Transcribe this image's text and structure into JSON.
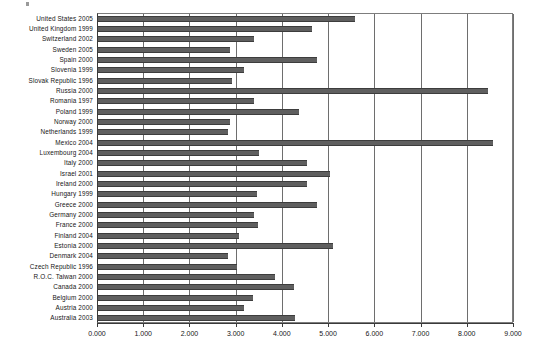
{
  "chart_data": {
    "type": "bar",
    "orientation": "horizontal",
    "title": "",
    "subtitle": "",
    "xlabel": "",
    "ylabel": "",
    "xlim": [
      0.0,
      9.0
    ],
    "xticks": [
      0.0,
      1.0,
      2.0,
      3.0,
      4.0,
      5.0,
      6.0,
      7.0,
      8.0,
      9.0
    ],
    "xtick_labels": [
      "0.000",
      "1.000",
      "2.000",
      "3.000",
      "4.000",
      "5.000",
      "6.000",
      "7.000",
      "8.000",
      "9.000"
    ],
    "grid": "vertical",
    "legend": null,
    "legend_position": "none",
    "bar_color": "#5f5f5f",
    "bar_edge_color": "#3d3d3d",
    "axis_color": "#3a3a3a",
    "gridline_color": "#6e6e6e",
    "background_color": "#ffffff",
    "categories": [
      "United States 2005",
      "United Kingdom 1999",
      "Switzerland 2002",
      "Sweden 2005",
      "Spain 2000",
      "Slovenia 1999",
      "Slovak Republic 1996",
      "Russia 2000",
      "Romania 1997",
      "Poland 1999",
      "Norway 2000",
      "Netherlands 1999",
      "Mexico 2004",
      "Luxembourg 2004",
      "Italy 2000",
      "Israel 2001",
      "Ireland 2000",
      "Hungary 1999",
      "Greece 2000",
      "Germany 2000",
      "France 2000",
      "Finland 2004",
      "Estonia 2000",
      "Denmark 2004",
      "Czech Republic 1996",
      "R.O.C. Taiwan 2000",
      "Canada 2000",
      "Belgium 2000",
      "Austria 2000",
      "Australia 2003"
    ],
    "values": [
      5.55,
      4.62,
      3.38,
      2.86,
      4.74,
      3.16,
      2.9,
      8.43,
      3.38,
      4.35,
      2.85,
      2.81,
      8.55,
      3.48,
      4.52,
      5.03,
      4.52,
      3.44,
      4.74,
      3.37,
      3.46,
      3.06,
      5.08,
      2.81,
      3.01,
      3.82,
      4.23,
      3.35,
      3.15,
      4.27
    ]
  }
}
